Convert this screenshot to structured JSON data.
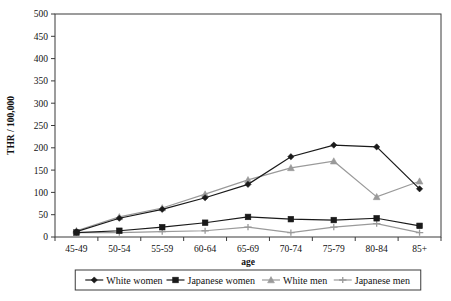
{
  "chart_data": {
    "type": "line",
    "title": "",
    "xlabel": "age",
    "ylabel": "THR / 100,000",
    "categories": [
      "45-49",
      "50-54",
      "55-59",
      "60-64",
      "65-69",
      "70-74",
      "75-79",
      "80-84",
      "85+"
    ],
    "ylim": [
      0,
      500
    ],
    "yticks": [
      0,
      50,
      100,
      150,
      200,
      250,
      300,
      350,
      400,
      450,
      500
    ],
    "grid": false,
    "legend_position": "bottom",
    "series": [
      {
        "name": "White women",
        "marker": "diamond",
        "color": "#1a1a1a",
        "values": [
          12,
          42,
          62,
          88,
          118,
          180,
          206,
          202,
          108
        ]
      },
      {
        "name": "Japanese women",
        "marker": "square",
        "color": "#1a1a1a",
        "values": [
          10,
          14,
          22,
          32,
          45,
          40,
          38,
          42,
          25
        ]
      },
      {
        "name": "White men",
        "marker": "triangle",
        "color": "#9a9a9a",
        "values": [
          14,
          45,
          65,
          96,
          128,
          155,
          170,
          90,
          125
        ]
      },
      {
        "name": "Japanese men",
        "marker": "cross",
        "color": "#9a9a9a",
        "values": [
          10,
          10,
          12,
          14,
          22,
          10,
          22,
          30,
          10
        ]
      }
    ]
  },
  "axis": {
    "y_title": "THR / 100,000",
    "x_title": "age"
  },
  "colors": {
    "frame": "#3b3b3b",
    "dark_series": "#1a1a1a",
    "light_series": "#9a9a9a",
    "background": "#ffffff"
  }
}
